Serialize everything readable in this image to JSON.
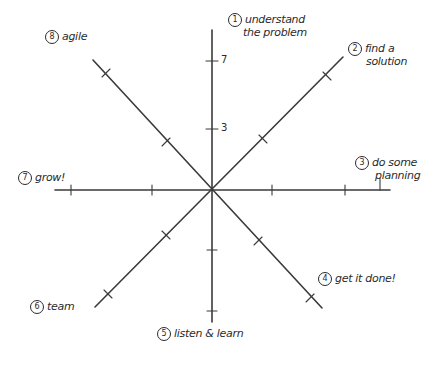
{
  "diagram": {
    "type": "radial-axes",
    "center": {
      "x": 212,
      "y": 189
    },
    "stroke_color": "#3a3a3a",
    "axis_ticks": [
      {
        "value": "7",
        "x": 222,
        "y": 54
      },
      {
        "value": "3",
        "x": 222,
        "y": 122
      }
    ],
    "spokes": [
      {
        "id": 1,
        "label_line1": "understand",
        "label_line2": "the problem",
        "number": "1"
      },
      {
        "id": 2,
        "label_line1": "find a",
        "label_line2": "solution",
        "number": "2"
      },
      {
        "id": 3,
        "label_line1": "do some",
        "label_line2": "planning",
        "number": "3"
      },
      {
        "id": 4,
        "label_line1": "get it done!",
        "label_line2": "",
        "number": "4"
      },
      {
        "id": 5,
        "label_line1": "listen & learn",
        "label_line2": "",
        "number": "5"
      },
      {
        "id": 6,
        "label_line1": "team",
        "label_line2": "",
        "number": "6"
      },
      {
        "id": 7,
        "label_line1": "grow!",
        "label_line2": "",
        "number": "7"
      },
      {
        "id": 8,
        "label_line1": "agile",
        "label_line2": "",
        "number": "8"
      }
    ]
  }
}
